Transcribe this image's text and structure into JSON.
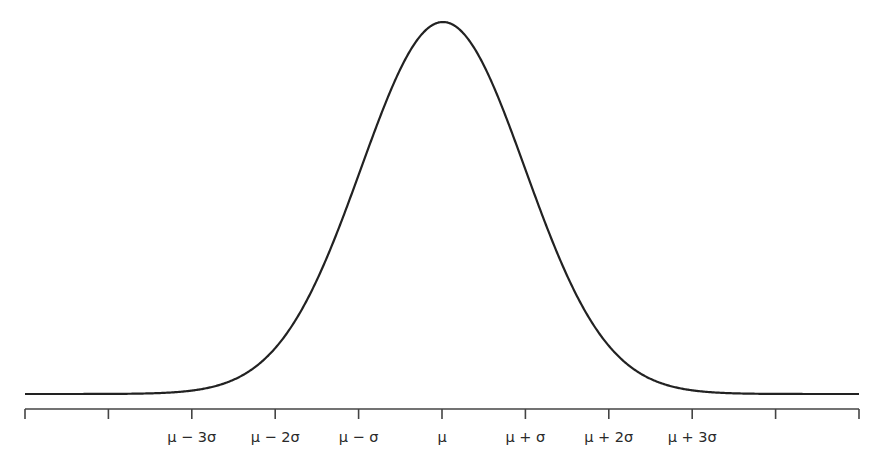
{
  "chart_data": {
    "type": "line",
    "title": "",
    "xlabel": "",
    "ylabel": "",
    "mean_label": "μ",
    "x_ticks_count": 11,
    "tick_labels": [
      "",
      "",
      "μ − 3σ",
      "μ − 2σ",
      "μ − σ",
      "μ",
      "μ + σ",
      "μ + 2σ",
      "μ + 3σ",
      "",
      ""
    ],
    "x_range_sigma": [
      -5,
      5
    ],
    "grid": false,
    "legend": null,
    "series": [
      {
        "name": "normal density",
        "function": "exp(-x^2/2)",
        "x": [
          -5,
          -4,
          -3,
          -2,
          -1,
          0,
          1,
          2,
          3,
          4,
          5
        ],
        "values": [
          3.7e-06,
          0.000335,
          0.0111,
          0.1353,
          0.6065,
          1.0,
          0.6065,
          0.1353,
          0.0111,
          0.000335,
          3.7e-06
        ]
      }
    ],
    "colors": {
      "curve": "#222222",
      "axis": "#444444"
    }
  },
  "layout": {
    "axis_left_px": 25,
    "axis_right_px": 859,
    "axis_y_px": 409,
    "tick_len_px": 10,
    "peak_x_px": 443,
    "peak_y_px": 22,
    "baseline_y_px": 394,
    "sigma_px": 82,
    "tick_spacing_px": 83.4
  }
}
